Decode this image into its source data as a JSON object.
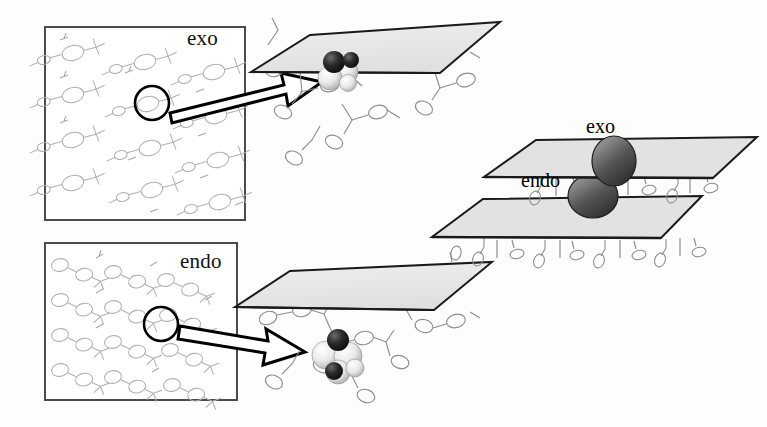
{
  "figure": {
    "type": "crystal-packing-inclusion-diagram",
    "background_color": "#fdfdfd",
    "width": 767,
    "height": 427
  },
  "panels": {
    "exo": {
      "label": "exo",
      "box": {
        "x": 45,
        "y": 27,
        "width": 200,
        "height": 193
      },
      "border_color": "#4b4b4b",
      "highlight_circle": {
        "cx": 152,
        "cy": 103,
        "r": 17,
        "color": "#000000"
      },
      "arrow": {
        "name": "exo-expansion-arrow",
        "from_x": 168,
        "from_y": 108,
        "to_x": 322,
        "to_y": 70,
        "style": "hollow-block-arrow",
        "color": "#000000"
      }
    },
    "endo": {
      "label": "endo",
      "box": {
        "x": 45,
        "y": 243,
        "width": 192,
        "height": 157
      },
      "border_color": "#4b4b4b",
      "highlight_circle": {
        "cx": 161,
        "cy": 324,
        "r": 17,
        "color": "#000000"
      },
      "arrow": {
        "name": "endo-expansion-arrow",
        "from_x": 178,
        "from_y": 330,
        "to_x": 300,
        "to_y": 360,
        "style": "hollow-block-arrow",
        "color": "#000000"
      }
    }
  },
  "structures": {
    "exo_structure": {
      "name": "exo-host-guest-structure",
      "plane": {
        "fill": "#ebebeb",
        "stroke": "#1a1a1a"
      },
      "guest_model": "space-filling",
      "guest_atom_colors": {
        "dark": "#1c1c1c",
        "light": "#f2f2f2"
      },
      "guest_position": "on-outer-face-of-layer"
    },
    "endo_structure": {
      "name": "endo-host-guest-structure",
      "plane": {
        "fill": "#ebebeb",
        "stroke": "#1a1a1a"
      },
      "guest_model": "space-filling",
      "guest_atom_colors": {
        "dark": "#1c1c1c",
        "light": "#f2f2f2"
      },
      "guest_position": "within-pendant-cavity"
    }
  },
  "schematic": {
    "name": "layer-stack-schematic",
    "exo_label": "exo",
    "endo_label": "endo",
    "planes": [
      {
        "name": "upper-plane",
        "fill": "#dcdcdc",
        "stroke": "#1a1a1a"
      },
      {
        "name": "lower-plane",
        "fill": "#dcdcdc",
        "stroke": "#1a1a1a"
      }
    ],
    "spheres": [
      {
        "name": "exo-sphere",
        "cx": 614,
        "cy": 161,
        "rx": 22,
        "ry": 25,
        "color": "#4a4a4a"
      },
      {
        "name": "endo-sphere",
        "cx": 593,
        "cy": 196,
        "rx": 25,
        "ry": 22,
        "color": "#4a4a4a"
      }
    ]
  },
  "colors": {
    "plane_fill": "#ebebeb",
    "plane_stroke": "#1a1a1a",
    "sphere_dark": "#4a4a4a",
    "molecule_stroke": "#9a9a9a",
    "box_border": "#4b4b4b",
    "text": "#111111"
  }
}
